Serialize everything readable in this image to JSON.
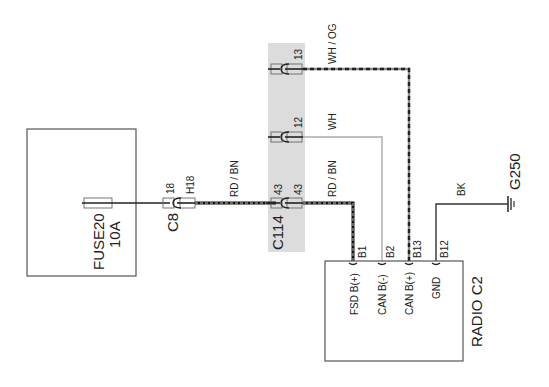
{
  "diagram": {
    "fuse_block": {
      "name": "FUSE20",
      "rating": "10A"
    },
    "connector_c8": {
      "name": "C8",
      "pin_left": "18",
      "pin_right": "H18"
    },
    "connector_c114": {
      "name": "C114",
      "pins": [
        {
          "left": "43",
          "right": "43"
        },
        {
          "left": "12"
        },
        {
          "left": "13"
        }
      ],
      "shade_color": "#dcdcdc"
    },
    "wires": {
      "rdbn_1": "RD / BN",
      "rdbn_2": "RD / BN",
      "wh": "WH",
      "whog": "WH / OG",
      "bk": "BK"
    },
    "radio": {
      "name": "RADIO C2",
      "pins": [
        {
          "id": "B1",
          "label": "FSD B(+)"
        },
        {
          "id": "B2",
          "label": "CAN B(-)"
        },
        {
          "id": "B13",
          "label": "CAN B(+)"
        },
        {
          "id": "B12",
          "label": "GND"
        }
      ]
    },
    "ground": {
      "name": "G250"
    }
  }
}
